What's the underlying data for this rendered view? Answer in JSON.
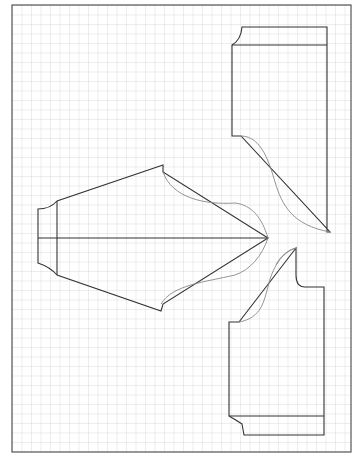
{
  "diagram": {
    "type": "sewing-pattern",
    "grid": {
      "spacing_px": 9.5,
      "line_color": "#d2d2d2",
      "border_color": "#555555"
    },
    "colors": {
      "pattern_line": "#333333",
      "curve_line": "#888888",
      "paper": "#ffffff"
    },
    "pieces": [
      {
        "id": "sleeve",
        "label": "Sleeve"
      },
      {
        "id": "upper-bodice",
        "label": "Bodice piece (top)"
      },
      {
        "id": "lower-bodice",
        "label": "Bodice piece (bottom)"
      }
    ]
  }
}
